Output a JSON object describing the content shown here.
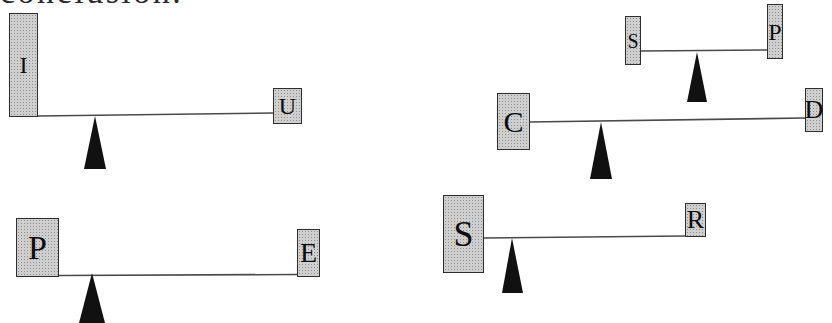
{
  "document": {
    "clipped_heading": "conclusion."
  },
  "figure": {
    "levers": [
      {
        "left_label": "I",
        "right_label": "U"
      },
      {
        "left_label": "S",
        "right_label": "P"
      },
      {
        "left_label": "C",
        "right_label": "D"
      },
      {
        "left_label": "P",
        "right_label": "E"
      },
      {
        "left_label": "S",
        "right_label": "R"
      }
    ]
  },
  "colors": {
    "background": "#ffffff",
    "weight_fill": "#cfcfcf",
    "weight_stipple": "#8e8e8e",
    "weight_border": "#2e2e2e",
    "beam": "#4a4a4a",
    "fulcrum": "#111111",
    "letter": "#0d0d0d"
  }
}
